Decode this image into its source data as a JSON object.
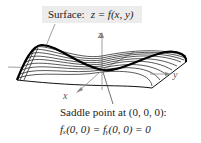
{
  "figure": {
    "surface_label": {
      "prefix": "Surface:",
      "equation": "z = f(x,  y)"
    },
    "axes": {
      "x": "x",
      "y": "y",
      "z": "z"
    },
    "annotation": {
      "line1": "Saddle point at (0,  0,  0):",
      "line2": "fₓ(0,  0) = fᵧ(0,  0) = 0"
    },
    "colors": {
      "surface_lines": "#111111",
      "axes": "#888888",
      "label_bg": "#ececec"
    }
  }
}
